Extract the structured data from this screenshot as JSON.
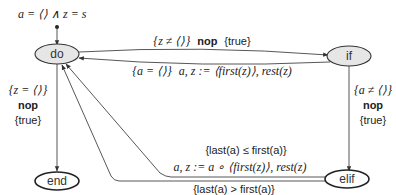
{
  "diagram": {
    "initial_condition": "a = ⟨⟩ ∧ z = s",
    "nodes": [
      {
        "id": "do",
        "label": "do",
        "fill": "#e6e6e6"
      },
      {
        "id": "if",
        "label": "if",
        "fill": "#e6e6e6"
      },
      {
        "id": "end",
        "label": "end",
        "fill": "#ffffff"
      },
      {
        "id": "elif",
        "label": "elif",
        "fill": "#ffffff"
      }
    ],
    "edges": {
      "do_to_if": {
        "pre": "{z ≠ ⟨⟩}",
        "action": "nop",
        "post": "{true}"
      },
      "if_to_do": {
        "guard": "{a = ⟨⟩}",
        "assign": "a, z := ⟨first(z)⟩, rest(z)"
      },
      "do_to_end": {
        "pre": "{z = ⟨⟩}",
        "action": "nop",
        "post": "{true}"
      },
      "if_to_elif": {
        "pre": "{a ≠ ⟨⟩}",
        "action": "nop",
        "post": "{true}"
      },
      "elif_to_do_le": {
        "guard": "{last(a) ≤ first(a)}",
        "assign": "a, z := a ∘ ⟨first(z)⟩, rest(z)"
      },
      "elif_to_do_gt": {
        "guard": "{last(a) > first(a)}",
        "assign": "a, z := head(a), ⟨first(z)⟩ ∘ ⟨last(a)⟩ ∘ rest(z)"
      }
    },
    "colors": {
      "stroke": "#333333",
      "edge": "#444444",
      "text": "#222222"
    }
  }
}
